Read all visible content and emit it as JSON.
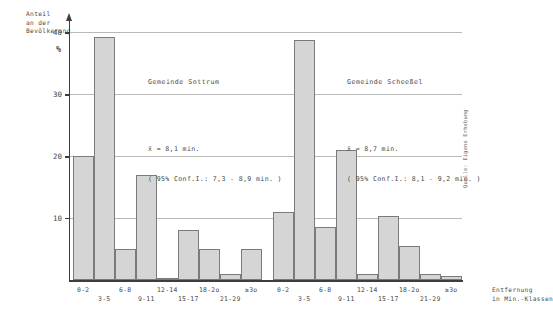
{
  "axes": {
    "y_title": "Anteil\nan der\nBevölkerung",
    "y_unit": "%",
    "x_title": "Entfernung\nin Min.-Klassen",
    "y_ticks": [
      "40",
      "30",
      "20",
      "10"
    ],
    "y_tick_values": [
      40,
      30,
      20,
      10
    ]
  },
  "groups": [
    {
      "title": "Gemeinde Sottrum",
      "mean_line": "x̄ = 8,1 min.",
      "ci_line": "( 95% Conf.I.: 7,3 - 8,9 min. )"
    },
    {
      "title": "Gemeinde Scheeßel",
      "mean_line": "x̄ = 8,7 min.",
      "ci_line": "( 95% Conf.I.: 8,1 - 9,2 min. )"
    }
  ],
  "source_note": "Quelle: Eigene Erhebung",
  "chart_data": {
    "type": "bar",
    "title": "",
    "xlabel": "Entfernung in Min.-Klassen",
    "ylabel": "Anteil an der Bevölkerung %",
    "ylim": [
      0,
      42
    ],
    "grid": true,
    "legend": "none",
    "categories": [
      "0-2",
      "3-5",
      "6-8",
      "9-11",
      "12-14",
      "15-17",
      "18-2o",
      "21-29",
      "≥3o"
    ],
    "panels": [
      {
        "name": "Gemeinde Sottrum",
        "mean": 8.1,
        "ci_low": 7.3,
        "ci_high": 8.9,
        "values": [
          20.0,
          39.3,
          5.0,
          17.0,
          0.4,
          8.0,
          5.0,
          1.0,
          5.0
        ]
      },
      {
        "name": "Gemeinde Scheeßel",
        "mean": 8.7,
        "ci_low": 8.1,
        "ci_high": 9.2,
        "values": [
          11.0,
          38.8,
          8.6,
          21.0,
          1.0,
          10.3,
          5.5,
          1.0,
          0.6
        ]
      }
    ]
  }
}
